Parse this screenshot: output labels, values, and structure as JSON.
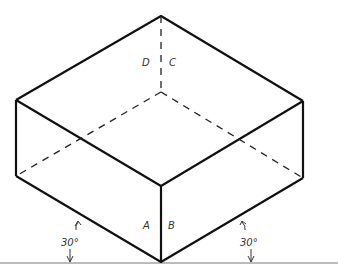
{
  "diagram": {
    "colors": {
      "line": "#111111",
      "ground": "#666666",
      "hidden": "#222222",
      "label": "#333333"
    },
    "vertices": {
      "top": [
        161,
        16
      ],
      "left_top": [
        16,
        100
      ],
      "right_top": [
        303,
        101
      ],
      "front_top": [
        161,
        186
      ],
      "hidden_center": [
        161,
        92
      ],
      "left_bottom": [
        16,
        176
      ],
      "right_bottom": [
        303,
        178
      ],
      "bottom": [
        161,
        262
      ]
    },
    "labels": {
      "D": "D",
      "C": "C",
      "A": "A",
      "B": "B"
    },
    "angles": {
      "left": "30°",
      "right": "30°"
    },
    "ground_line": {
      "y": 263
    }
  }
}
